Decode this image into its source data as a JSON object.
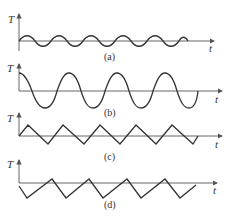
{
  "figure": {
    "panels": [
      {
        "id": "a",
        "caption": "(a)",
        "y_label": "T",
        "x_label": "t",
        "waveform": "sine, small amplitude"
      },
      {
        "id": "b",
        "caption": "(b)",
        "y_label": "T",
        "x_label": "t",
        "waveform": "cosine, large amplitude"
      },
      {
        "id": "c",
        "caption": "(c)",
        "y_label": "T",
        "x_label": "t",
        "waveform": "triangle"
      },
      {
        "id": "d",
        "caption": "(d)",
        "y_label": "T",
        "x_label": "t",
        "waveform": "triangle, offset downward"
      }
    ]
  },
  "colors": {
    "line": "#333333",
    "axis": "#555555",
    "background": "#ffffff"
  }
}
